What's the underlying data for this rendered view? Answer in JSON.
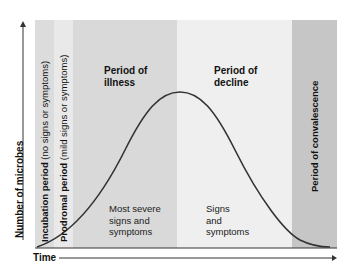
{
  "diagram": {
    "y_axis_label": "Number of microbes",
    "x_axis_label": "Time",
    "periods": [
      {
        "name": "Incubation period",
        "detail": "(no signs or symptoms)",
        "color": "#dcdcdc"
      },
      {
        "name": "Prodromal period",
        "detail": "(mild signs or symptoms)",
        "color": "#e9e9e9"
      },
      {
        "name": "Period of illness",
        "line1": "Period of",
        "line2": "illness",
        "color": "#d9d9d9",
        "note": [
          "Most severe",
          "signs and",
          "symptoms"
        ]
      },
      {
        "name": "Period of decline",
        "line1": "Period of",
        "line2": "decline",
        "color": "#efefef",
        "note": [
          "Signs",
          "and",
          "symptoms"
        ]
      },
      {
        "name": "Period of convalescence",
        "color": "#c6c6c6"
      }
    ],
    "curve": {
      "shape": "bell",
      "peak_period": "Period of illness / decline boundary",
      "color": "#333333"
    }
  }
}
